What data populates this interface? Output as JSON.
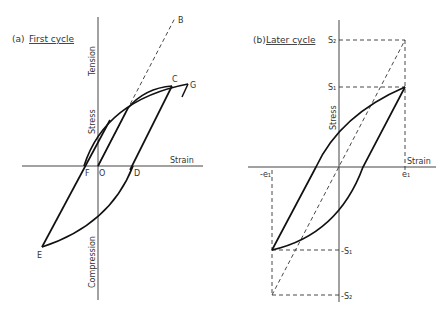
{
  "panel_a": {
    "title_prefix": "(a)",
    "title": "First cycle",
    "y_axis_upper": "Tension",
    "y_axis_mid": "Stress",
    "y_axis_lower": "Compression",
    "x_axis": "Strain",
    "points": {
      "B": "B",
      "C": "C",
      "G": "G",
      "F": "F",
      "O": "O",
      "D": "D",
      "E": "E"
    }
  },
  "panel_b": {
    "title_prefix": "(b)",
    "title": "Later cycle",
    "y_axis": "Stress",
    "x_axis": "Strain",
    "labels": {
      "S2": "S₂",
      "S1": "S₁",
      "e1": "e₁",
      "neg_e1": "-e₁",
      "neg_S1": "-S₁",
      "neg_S2": "-S₂"
    }
  }
}
